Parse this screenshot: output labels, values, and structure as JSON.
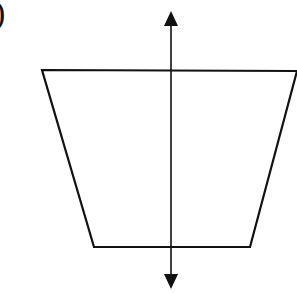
{
  "figure": {
    "label": "b)",
    "visible_label": ")",
    "shape": "trapezoid",
    "trapezoid": {
      "points": [
        [
          42,
          70
        ],
        [
          297,
          71
        ],
        [
          250,
          247
        ],
        [
          94,
          247
        ]
      ],
      "stroke": "#111111",
      "fill": "#ffffff"
    },
    "axis": {
      "orientation": "vertical",
      "x": 171,
      "y_top": 12,
      "y_bottom": 288,
      "arrowheads": [
        "up",
        "down"
      ],
      "color": "#111111"
    }
  }
}
